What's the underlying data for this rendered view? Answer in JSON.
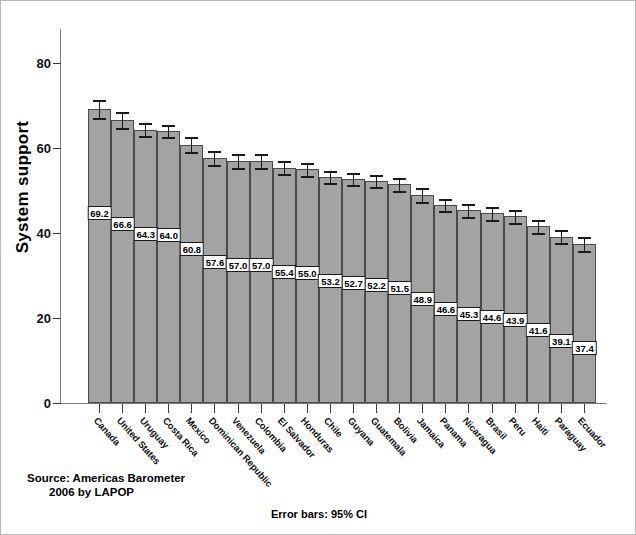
{
  "chart_data": {
    "type": "bar",
    "title": "",
    "xlabel": "",
    "ylabel": "System support",
    "ylim": [
      0,
      88
    ],
    "yticks": [
      0,
      20,
      40,
      60,
      80
    ],
    "grid": false,
    "legend": null,
    "error_bar_note": "Error bars: 95% CI",
    "source_note_line1": "Source: Americas Barometer",
    "source_note_line2": "2006 by LAPOP",
    "categories": [
      "Canada",
      "United States",
      "Uruguay",
      "Costa Rica",
      "Mexico",
      "Dominican Republic",
      "Venezuela",
      "Colombia",
      "El Salvador",
      "Honduras",
      "Chile",
      "Guyana",
      "Guatemala",
      "Bolivia",
      "Jamaica",
      "Panama",
      "Nicaragua",
      "Brasil",
      "Peru",
      "Haiti",
      "Paraguay",
      "Ecuador"
    ],
    "values": [
      69.2,
      66.6,
      64.3,
      64.0,
      60.8,
      57.6,
      57.0,
      57.0,
      55.4,
      55.0,
      53.2,
      52.7,
      52.2,
      51.5,
      48.9,
      46.6,
      45.3,
      44.6,
      43.9,
      41.6,
      39.1,
      37.4
    ],
    "value_labels": [
      "69.2",
      "66.6",
      "64.3",
      "64.0",
      "60.8",
      "57.6",
      "57.0",
      "57.0",
      "55.4",
      "55.0",
      "53.2",
      "52.7",
      "52.2",
      "51.5",
      "48.9",
      "46.6",
      "45.3",
      "44.6",
      "43.9",
      "41.6",
      "39.1",
      "37.4"
    ],
    "ci_half_width": [
      2.2,
      1.9,
      1.5,
      1.5,
      1.8,
      1.6,
      1.6,
      1.7,
      1.5,
      1.5,
      1.4,
      1.4,
      1.4,
      1.5,
      1.6,
      1.5,
      1.5,
      1.5,
      1.5,
      1.5,
      1.5,
      1.6
    ],
    "colors": {
      "bar_fill": "#a3a3a3",
      "bar_stroke": "#4a4a4a",
      "error_bar": "#1a1a1a",
      "axis": "#7a7a7a",
      "text": "#000000",
      "background": "#ffffff",
      "frame": "#b8b8b8"
    }
  }
}
